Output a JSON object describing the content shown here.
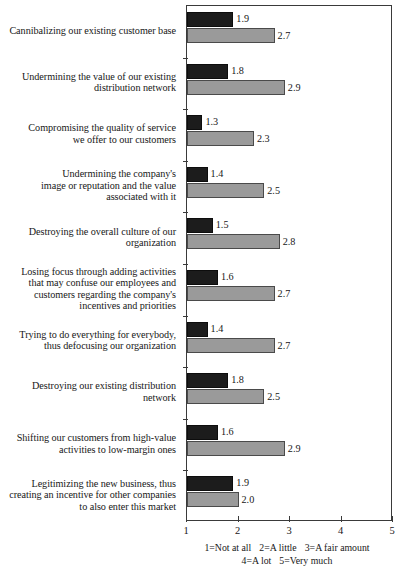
{
  "chart_data": {
    "type": "bar",
    "orientation": "horizontal",
    "title": "",
    "xlabel": "",
    "ylabel": "",
    "xlim": [
      1,
      5
    ],
    "xticks": [
      "1",
      "2",
      "3",
      "4",
      "5"
    ],
    "grid": false,
    "legend_position": "none",
    "colors": {
      "series_1": "#1c1c1c",
      "series_2": "#9a9a9a",
      "axis": "#3a3a3a",
      "text": "#171717",
      "background": "#ffffff"
    },
    "categories": [
      "Cannibalizing our existing customer base",
      "Undermining the value of our existing distribution network",
      "Compromising the quality of service we offer to our customers",
      "Undermining the company's image or reputation and the value associated with it",
      "Destroying the overall culture of our organization",
      "Losing focus through adding activities that may confuse our employees and customers regarding the company's incentives and priorities",
      "Trying to do everything for everybody, thus defocusing our organization",
      "Destroying our existing distribution network",
      "Shifting our customers from high-value activities to low-margin ones",
      "Legitimizing the new business, thus creating an incentive for other companies to also enter this market"
    ],
    "category_lines": [
      [
        "Cannibalizing our existing customer base"
      ],
      [
        "Undermining the value of our existing",
        "distribution network"
      ],
      [
        "Compromising the quality of service",
        "we offer to our customers"
      ],
      [
        "Undermining the company's",
        "image or reputation and the value",
        "associated with it"
      ],
      [
        "Destroying the overall culture of our",
        "organization"
      ],
      [
        "Losing focus through adding activities",
        "that may confuse our employees and",
        "customers regarding the company's",
        "incentives and priorities"
      ],
      [
        "Trying to do everything for everybody,",
        "thus defocusing our organization"
      ],
      [
        "Destroying our existing distribution",
        "network"
      ],
      [
        "Shifting our customers from high-value",
        "activities to low-margin ones"
      ],
      [
        "Legitimizing the new business, thus",
        "creating an incentive for other companies",
        "to also enter this market"
      ]
    ],
    "series": [
      {
        "name": "series-dark",
        "values": [
          1.9,
          1.8,
          1.3,
          1.4,
          1.5,
          1.6,
          1.4,
          1.8,
          1.6,
          1.9
        ],
        "labels": [
          "1.9",
          "1.8",
          "1.3",
          "1.4",
          "1.5",
          "1.6",
          "1.4",
          "1.8",
          "1.6",
          "1.9"
        ]
      },
      {
        "name": "series-gray",
        "values": [
          2.7,
          2.9,
          2.3,
          2.5,
          2.8,
          2.7,
          2.7,
          2.5,
          2.9,
          2.0
        ],
        "labels": [
          "2.7",
          "2.9",
          "2.3",
          "2.5",
          "2.8",
          "2.7",
          "2.7",
          "2.5",
          "2.9",
          "2.0"
        ]
      }
    ]
  },
  "caption": {
    "line1": [
      "1=Not at all",
      "2=A little",
      "3=A fair amount"
    ],
    "line2": [
      "4=A lot",
      "5=Very much"
    ]
  }
}
